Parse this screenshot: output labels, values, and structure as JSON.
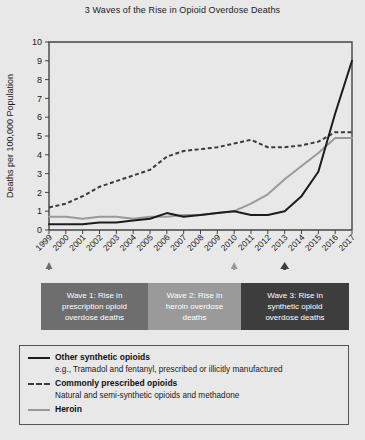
{
  "chart_data": {
    "type": "line",
    "title": "3 Waves of the Rise in Opioid Overdose Deaths",
    "xlabel": "",
    "ylabel": "Deaths per 100,000 Population",
    "xlim": [
      1999,
      2017
    ],
    "ylim": [
      0,
      10
    ],
    "ytick_labels": [
      "0",
      "1",
      "2",
      "3",
      "4",
      "5",
      "6",
      "7",
      "8",
      "9",
      "10"
    ],
    "yticks": [
      0,
      1,
      2,
      3,
      4,
      5,
      6,
      7,
      8,
      9,
      10
    ],
    "grid": false,
    "legend_position": "below-plot",
    "categories": [
      1999,
      2000,
      2001,
      2002,
      2003,
      2004,
      2005,
      2006,
      2007,
      2008,
      2009,
      2010,
      2011,
      2012,
      2013,
      2014,
      2015,
      2016,
      2017
    ],
    "xtick_labels": [
      "1999",
      "2000",
      "2001",
      "2002",
      "2003",
      "2004",
      "2005",
      "2006",
      "2007",
      "2008",
      "2009",
      "2010",
      "2011",
      "2012",
      "2013",
      "2014",
      "2015",
      "2016",
      "2017"
    ],
    "series": [
      {
        "name": "Other synthetic opioids",
        "style": "solid",
        "color": "#1c1c1c",
        "values": [
          0.3,
          0.3,
          0.3,
          0.4,
          0.4,
          0.5,
          0.6,
          0.9,
          0.7,
          0.8,
          0.9,
          1.0,
          0.8,
          0.8,
          1.0,
          1.8,
          3.1,
          6.2,
          9.0
        ]
      },
      {
        "name": "Commonly prescribed opioids",
        "style": "dashed",
        "color": "#3a3a3a",
        "values": [
          1.2,
          1.4,
          1.8,
          2.3,
          2.6,
          2.9,
          3.2,
          3.9,
          4.2,
          4.3,
          4.4,
          4.6,
          4.8,
          4.4,
          4.4,
          4.5,
          4.7,
          5.2,
          5.2
        ]
      },
      {
        "name": "Heroin",
        "style": "gray",
        "color": "#9a9a9a",
        "values": [
          0.7,
          0.7,
          0.6,
          0.7,
          0.7,
          0.6,
          0.7,
          0.7,
          0.8,
          0.8,
          0.9,
          1.0,
          1.4,
          1.9,
          2.7,
          3.4,
          4.1,
          4.9,
          4.9
        ]
      }
    ],
    "annotations": [
      {
        "id": "wave-1",
        "label": "Wave 1: Rise in prescription opioid overdose deaths",
        "lines": [
          "Wave 1: Rise in",
          "prescription opioid",
          "overdose deaths"
        ],
        "marker_year": 1999,
        "color": "#6e6e6e"
      },
      {
        "id": "wave-2",
        "label": "Wave 2: Rise in heroin overdose deaths",
        "lines": [
          "Wave 2: Rise in",
          "heroin overdose",
          "deaths"
        ],
        "marker_year": 2010,
        "color": "#9a9a9a"
      },
      {
        "id": "wave-3",
        "label": "Wave 3: Rise in synthetic opioid overdose deaths",
        "lines": [
          "Wave 3: Rise in",
          "synthetic opioid",
          "overdose deaths"
        ],
        "marker_year": 2013,
        "color": "#3d3d3d"
      }
    ],
    "legend": [
      {
        "style": "solid",
        "title": "Other synthetic opioids",
        "subtitle": "e.g., Tramadol and fentanyl, prescribed or illicitly manufactured"
      },
      {
        "style": "dashed",
        "title": "Commonly prescribed opioids",
        "subtitle": "Natural and semi-synthetic opioids and methadone"
      },
      {
        "style": "gray",
        "title": "Heroin",
        "subtitle": ""
      }
    ]
  },
  "colors": {
    "background": "#e8e8e8",
    "axis": "#444444",
    "text": "#1a1a1a"
  }
}
